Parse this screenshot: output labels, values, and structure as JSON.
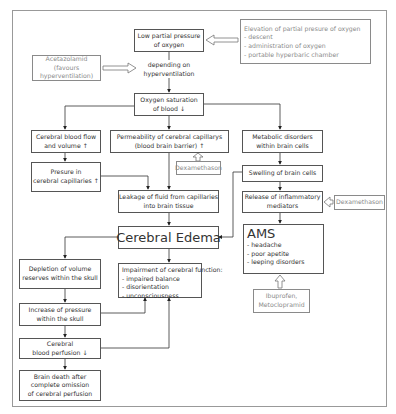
{
  "diagram": {
    "nodes": {
      "low_po2": {
        "lines": [
          "Low partial pressure",
          "of oxygen"
        ]
      },
      "elevation": {
        "lines": [
          "Elevation of partial presure of oxygen",
          "- descent",
          "- administration of oxygen",
          "- portable hyperbaric chamber"
        ]
      },
      "acetazolamid": {
        "lines": [
          "Acetazolamid",
          "(favours",
          "hyperventilation)"
        ]
      },
      "depending": {
        "lines": [
          "depending on",
          "hyperventilation"
        ]
      },
      "o2_sat": {
        "lines": [
          "Oxygen saturation",
          "of blood ↓"
        ]
      },
      "blood_flow": {
        "lines": [
          "Cerebral blood flow",
          "and volume ↑"
        ]
      },
      "permeability": {
        "lines": [
          "Permeability of cerebral capillarys",
          "(blood brain barrier)   ↑"
        ]
      },
      "metabolic": {
        "lines": [
          "Metabolic disorders",
          "within brain cells"
        ]
      },
      "dexa1": {
        "lines": [
          "Dexamethason"
        ]
      },
      "cap_pressure": {
        "lines": [
          "Presure in",
          "cerebral capillaries ↑"
        ]
      },
      "swelling": {
        "lines": [
          "Swelling of brain cells"
        ]
      },
      "leakage": {
        "lines": [
          "Leakage of fluid from capillaries",
          "into brain tissue"
        ]
      },
      "release": {
        "lines": [
          "Release of inflammatory",
          "mediators"
        ]
      },
      "dexa2": {
        "lines": [
          "Dexamethason"
        ]
      },
      "edema": {
        "lines": [
          "Cerebral Edema"
        ]
      },
      "ams": {
        "title": "AMS",
        "lines": [
          "- headache",
          "- poor apetite",
          "- leeping disorders"
        ]
      },
      "depletion": {
        "lines": [
          "Depletion of volume",
          "reserves within the skull"
        ]
      },
      "impairment": {
        "lines": [
          "Impairment of cerebral function:",
          "- impaired balance",
          "- disorientation",
          "- unconsciousness"
        ]
      },
      "ibuprofen": {
        "lines": [
          "Ibuprofen,",
          "Metoclopramid"
        ]
      },
      "increase": {
        "lines": [
          "Increase of pressure",
          "within the skull"
        ]
      },
      "perfusion": {
        "lines": [
          "Cerebral",
          "blood perfusion  ↓"
        ]
      },
      "brain_death": {
        "lines": [
          "Brain death after",
          "complete omission",
          "of cerebral perfusion"
        ]
      }
    },
    "colors": {
      "line": "#333333",
      "gray_border": "#8a8a8a",
      "frame": "#999999"
    }
  }
}
